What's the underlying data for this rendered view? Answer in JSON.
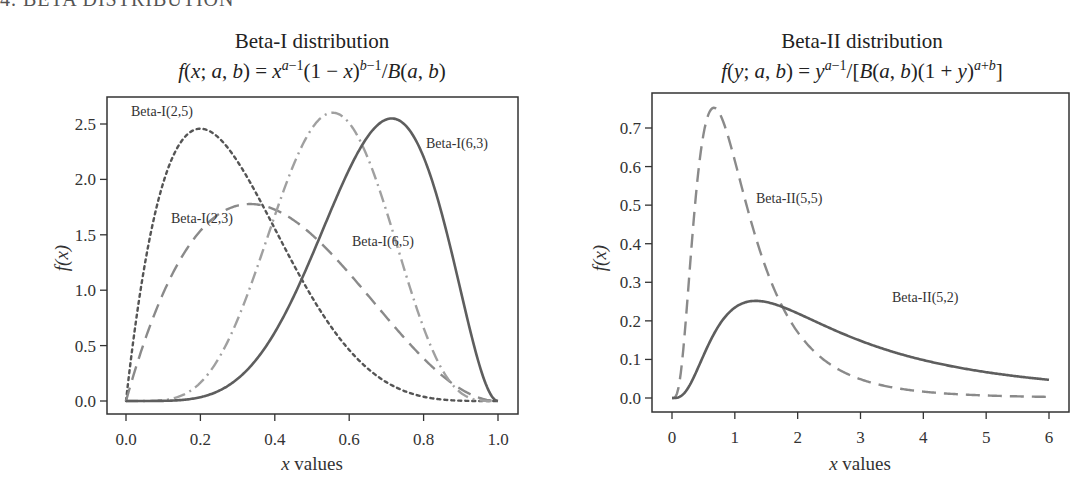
{
  "page": {
    "cut_heading": "4. BETA DISTRIBUTION"
  },
  "chart_data": [
    {
      "type": "line",
      "title": "Beta-I distribution",
      "subtitle": "f(x; a, b) = x^(a−1)(1 − x)^(b−1)/B(a, b)",
      "xlabel": "x values",
      "ylabel": "f(x)",
      "xlim": [
        0.0,
        1.0
      ],
      "ylim": [
        0.0,
        2.6
      ],
      "xticks": [
        "0.0",
        "0.2",
        "0.4",
        "0.6",
        "0.8",
        "1.0"
      ],
      "yticks": [
        "0.0",
        "0.5",
        "1.0",
        "1.5",
        "2.0",
        "2.5"
      ],
      "grid": false,
      "legend": "inline labels",
      "series": [
        {
          "name": "Beta-I(2,5)",
          "a": 2,
          "b": 5,
          "style": "dotted",
          "color": "#555555",
          "peak": {
            "x": 0.2,
            "y": 2.46
          }
        },
        {
          "name": "Beta-I(2,3)",
          "a": 2,
          "b": 3,
          "style": "dashed",
          "color": "#8a8a8a",
          "peak": {
            "x": 0.33,
            "y": 1.78
          }
        },
        {
          "name": "Beta-I(6,5)",
          "a": 6,
          "b": 5,
          "style": "dashdot",
          "color": "#a0a0a0",
          "peak": {
            "x": 0.56,
            "y": 2.62
          }
        },
        {
          "name": "Beta-I(6,3)",
          "a": 6,
          "b": 3,
          "style": "solid",
          "color": "#5e5e5e",
          "peak": {
            "x": 0.71,
            "y": 2.55
          }
        }
      ]
    },
    {
      "type": "line",
      "title": "Beta-II distribution",
      "subtitle": "f(y; a, b) = y^(a−1)/[B(a, b)(1 + y)^(a+b)]",
      "xlabel": "x values",
      "ylabel": "f(x)",
      "xlim": [
        0,
        6
      ],
      "ylim": [
        0.0,
        0.75
      ],
      "xticks": [
        "0",
        "1",
        "2",
        "3",
        "4",
        "5",
        "6"
      ],
      "yticks": [
        "0.0",
        "0.1",
        "0.2",
        "0.3",
        "0.4",
        "0.5",
        "0.6",
        "0.7"
      ],
      "grid": false,
      "legend": "inline labels",
      "series": [
        {
          "name": "Beta-II(5,5)",
          "a": 5,
          "b": 5,
          "style": "dashed",
          "color": "#8a8a8a",
          "peak": {
            "x": 0.67,
            "y": 0.75
          }
        },
        {
          "name": "Beta-II(5,2)",
          "a": 5,
          "b": 2,
          "style": "solid",
          "color": "#5e5e5e",
          "peak": {
            "x": 1.33,
            "y": 0.25
          }
        }
      ]
    }
  ],
  "plots": [
    {
      "title": "Beta-I distribution",
      "xlabel": "x values",
      "labels": [
        "Beta-I(2,5)",
        "Beta-I(2,3)",
        "Beta-I(6,5)",
        "Beta-I(6,3)"
      ]
    },
    {
      "title": "Beta-II distribution",
      "xlabel": "x values",
      "labels": [
        "Beta-II(5,5)",
        "Beta-II(5,2)"
      ]
    }
  ]
}
